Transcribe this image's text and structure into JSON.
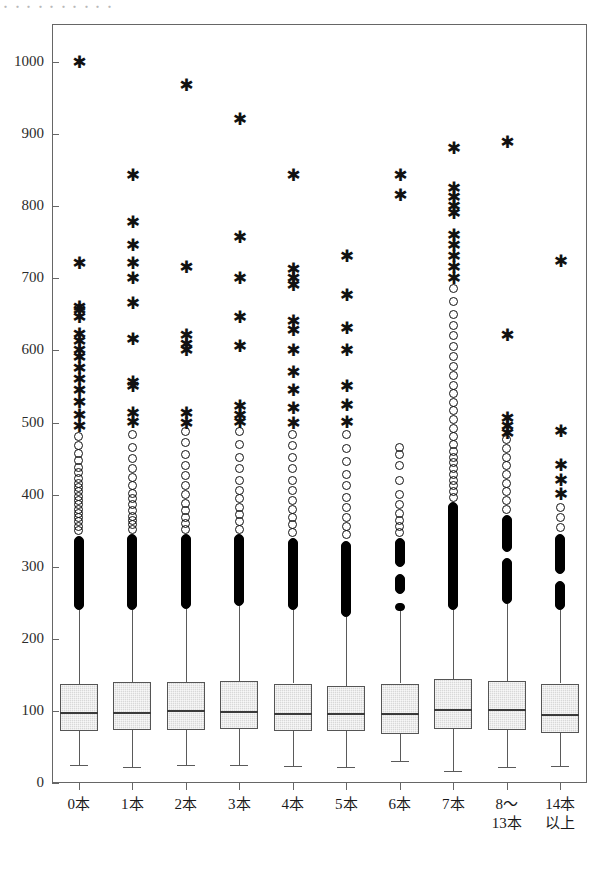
{
  "top_fragment": "・・・・・・・・・・",
  "chart_data": {
    "type": "box",
    "title": "",
    "subtitle": "",
    "xlabel": "",
    "ylabel": "",
    "ylim": [
      0,
      1050
    ],
    "yticks": [
      0,
      100,
      200,
      300,
      400,
      500,
      600,
      700,
      800,
      900,
      1000
    ],
    "ytick_labels": [
      "0",
      "100",
      "200",
      "300",
      "400",
      "500",
      "600",
      "700",
      "800",
      "900",
      "1000"
    ],
    "grid": false,
    "legend": null,
    "categories": [
      "0本",
      "1本",
      "2本",
      "3本",
      "4本",
      "5本",
      "6本",
      "7本",
      "8〜\n13本",
      "14本\n以上"
    ],
    "category_labels": [
      {
        "line1": "0本",
        "line2": ""
      },
      {
        "line1": "1本",
        "line2": ""
      },
      {
        "line1": "2本",
        "line2": ""
      },
      {
        "line1": "3本",
        "line2": ""
      },
      {
        "line1": "4本",
        "line2": ""
      },
      {
        "line1": "5本",
        "line2": ""
      },
      {
        "line1": "6本",
        "line2": ""
      },
      {
        "line1": "7本",
        "line2": ""
      },
      {
        "line1": "8〜",
        "line2": "13本"
      },
      {
        "line1": "14本",
        "line2": "以上"
      }
    ],
    "boxes": [
      {
        "category": "0本",
        "whisker_low": 25,
        "q1": 72,
        "median": 99,
        "q3": 137,
        "whisker_high": 240,
        "dense_outlier_ranges": [
          [
            240,
            342
          ]
        ],
        "mild_outliers": [
          350,
          356,
          362,
          368,
          374,
          380,
          386,
          392,
          398,
          404,
          410,
          416,
          422,
          430,
          438,
          447,
          457,
          468,
          480
        ],
        "extreme_outliers": [
          495,
          510,
          528,
          545,
          560,
          575,
          590,
          600,
          612,
          622,
          645,
          655,
          660,
          720,
          1000
        ]
      },
      {
        "category": "1本",
        "whisker_low": 22,
        "q1": 73,
        "median": 99,
        "q3": 140,
        "whisker_high": 240,
        "dense_outlier_ranges": [
          [
            240,
            345
          ]
        ],
        "mild_outliers": [
          352,
          358,
          364,
          370,
          378,
          386,
          394,
          402,
          412,
          424,
          436,
          450,
          466,
          484
        ],
        "extreme_outliers": [
          500,
          512,
          550,
          555,
          615,
          665,
          700,
          720,
          745,
          778,
          843
        ]
      },
      {
        "category": "2本",
        "whisker_low": 25,
        "q1": 74,
        "median": 101,
        "q3": 140,
        "whisker_high": 242,
        "dense_outlier_ranges": [
          [
            242,
            345
          ]
        ],
        "mild_outliers": [
          352,
          360,
          368,
          378,
          388,
          400,
          412,
          426,
          440,
          456,
          472,
          488
        ],
        "extreme_outliers": [
          498,
          512,
          600,
          608,
          620,
          715,
          968
        ]
      },
      {
        "category": "3本",
        "whisker_low": 25,
        "q1": 75,
        "median": 100,
        "q3": 142,
        "whisker_high": 245,
        "dense_outlier_ranges": [
          [
            245,
            345
          ]
        ],
        "mild_outliers": [
          352,
          362,
          372,
          382,
          394,
          406,
          420,
          436,
          452,
          470,
          488
        ],
        "extreme_outliers": [
          500,
          510,
          522,
          605,
          645,
          700,
          757,
          920
        ]
      },
      {
        "category": "4本",
        "whisker_low": 24,
        "q1": 72,
        "median": 97,
        "q3": 138,
        "whisker_high": 240,
        "dense_outlier_ranges": [
          [
            240,
            340
          ]
        ],
        "mild_outliers": [
          348,
          358,
          368,
          380,
          392,
          406,
          420,
          436,
          452,
          468,
          484
        ],
        "extreme_outliers": [
          498,
          520,
          545,
          570,
          600,
          628,
          640,
          690,
          700,
          712,
          842
        ]
      },
      {
        "category": "5本",
        "whisker_low": 22,
        "q1": 72,
        "median": 97,
        "q3": 135,
        "whisker_high": 230,
        "dense_outlier_ranges": [
          [
            230,
            335
          ]
        ],
        "mild_outliers": [
          344,
          356,
          368,
          382,
          396,
          412,
          428,
          446,
          464,
          484
        ],
        "extreme_outliers": [
          500,
          524,
          550,
          600,
          630,
          676,
          730
        ]
      },
      {
        "category": "6本",
        "whisker_low": 30,
        "q1": 68,
        "median": 97,
        "q3": 138,
        "whisker_high": 238,
        "dense_outlier_ranges": [
          [
            238,
            250
          ],
          [
            262,
            290
          ],
          [
            300,
            340
          ]
        ],
        "mild_outliers": [
          348,
          356,
          364,
          374,
          386,
          400,
          420,
          440,
          455,
          465
        ],
        "extreme_outliers": [
          815,
          843
        ]
      },
      {
        "category": "7本",
        "whisker_low": 16,
        "q1": 75,
        "median": 103,
        "q3": 144,
        "whisker_high": 240,
        "dense_outlier_ranges": [
          [
            240,
            390
          ]
        ],
        "mild_outliers": [
          396,
          404,
          412,
          420,
          428,
          436,
          444,
          452,
          460,
          470,
          480,
          492,
          504,
          516,
          528,
          540,
          552,
          565,
          578,
          592,
          606,
          620,
          634,
          650,
          668,
          686
        ],
        "extreme_outliers": [
          700,
          715,
          730,
          745,
          760,
          790,
          800,
          812,
          825,
          880
        ]
      },
      {
        "category": "8〜13本",
        "whisker_low": 22,
        "q1": 74,
        "median": 102,
        "q3": 142,
        "whisker_high": 248,
        "dense_outlier_ranges": [
          [
            248,
            312
          ],
          [
            320,
            372
          ]
        ],
        "mild_outliers": [
          380,
          392,
          404,
          416,
          428,
          440,
          452,
          464,
          476
        ],
        "extreme_outliers": [
          485,
          495,
          505,
          620,
          888
        ]
      },
      {
        "category": "14本以上",
        "whisker_low": 24,
        "q1": 70,
        "median": 96,
        "q3": 138,
        "whisker_high": 240,
        "dense_outlier_ranges": [
          [
            240,
            280
          ],
          [
            290,
            345
          ]
        ],
        "mild_outliers": [
          355,
          368,
          382
        ],
        "extreme_outliers": [
          400,
          420,
          440,
          488,
          723
        ]
      }
    ],
    "colors": {
      "box_fill": "#d8d8d8",
      "box_edge": "#555555",
      "median_line": "#3a3a3a",
      "whisker": "#5a5a5a",
      "outlier": "#111111",
      "frame": "#666666",
      "background": "#ffffff"
    }
  }
}
